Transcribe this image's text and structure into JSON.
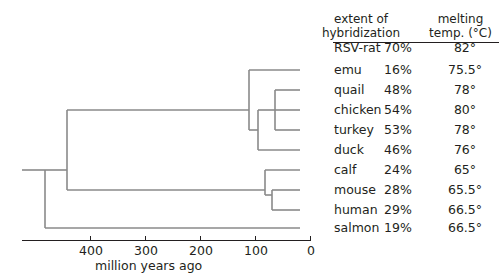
{
  "chart_data": {
    "type": "tree",
    "title": "",
    "xlabel": "million years ago",
    "axis": {
      "ticks": [
        400,
        300,
        200,
        100,
        0
      ],
      "tick_labels": [
        "400",
        "300",
        "200",
        "100",
        "0"
      ],
      "direction": "reversed",
      "xlim": [
        480,
        0
      ],
      "grid": false
    },
    "columns": [
      "",
      "extent of hybridization",
      "melting temp. (°C)"
    ],
    "header_line1": [
      "extent of",
      "melting"
    ],
    "header_line2": [
      "hybridization",
      "temp. (°C)"
    ],
    "rows": [
      {
        "name": "RSV-rat",
        "hybridization": "70%",
        "melting": "82°",
        "hyb_value": 70,
        "melt_value": 82
      },
      {
        "name": "emu",
        "hybridization": "16%",
        "melting": "75.5°",
        "hyb_value": 16,
        "melt_value": 75.5
      },
      {
        "name": "quail",
        "hybridization": "48%",
        "melting": "78°",
        "hyb_value": 48,
        "melt_value": 78
      },
      {
        "name": "chicken",
        "hybridization": "54%",
        "melting": "80°",
        "hyb_value": 54,
        "melt_value": 80
      },
      {
        "name": "turkey",
        "hybridization": "53%",
        "melting": "78°",
        "hyb_value": 53,
        "melt_value": 78
      },
      {
        "name": "duck",
        "hybridization": "46%",
        "melting": "76°",
        "hyb_value": 46,
        "melt_value": 76
      },
      {
        "name": "calf",
        "hybridization": "24%",
        "melting": "65°",
        "hyb_value": 24,
        "melt_value": 65
      },
      {
        "name": "mouse",
        "hybridization": "28%",
        "melting": "65.5°",
        "hyb_value": 28,
        "melt_value": 65.5
      },
      {
        "name": "human",
        "hybridization": "29%",
        "melting": "66.5°",
        "hyb_value": 29,
        "melt_value": 66.5
      },
      {
        "name": "salmon",
        "hybridization": "19%",
        "melting": "66.5°",
        "hyb_value": 19,
        "melt_value": 66.5
      }
    ],
    "tree_nodes": [
      {
        "id": "root",
        "children": [
          "tetrapod",
          "salmon"
        ],
        "x": 45
      },
      {
        "id": "tetrapod",
        "children": [
          "amniote"
        ],
        "x": 67
      },
      {
        "id": "amniote",
        "children": [
          "birds",
          "mammals"
        ],
        "x": 112
      },
      {
        "id": "birds",
        "children": [
          "emu",
          "neognath"
        ],
        "x": 249
      },
      {
        "id": "neognath",
        "children": [
          "galliform",
          "duck"
        ],
        "x": 258
      },
      {
        "id": "galliform",
        "children": [
          "quail",
          "chicken",
          "turkey"
        ],
        "x": 275
      },
      {
        "id": "mammals",
        "children": [
          "calf",
          "rodent-primate"
        ],
        "x": 265
      },
      {
        "id": "rodent-primate",
        "children": [
          "mouse",
          "human"
        ],
        "x": 272
      }
    ],
    "colors": {
      "line": "#8a8a8a",
      "text": "#231f20",
      "rule": "#231f20",
      "background": "#ffffff"
    }
  },
  "tick_labels": {
    "t400": "400",
    "t300": "300",
    "t200": "200",
    "t100": "100",
    "t0": "0"
  },
  "axis_title": "million years ago",
  "header": {
    "hyb_line1": "extent of",
    "hyb_line2": "hybridization",
    "melt_line1": "melting",
    "melt_line2": "temp. (°C)"
  }
}
